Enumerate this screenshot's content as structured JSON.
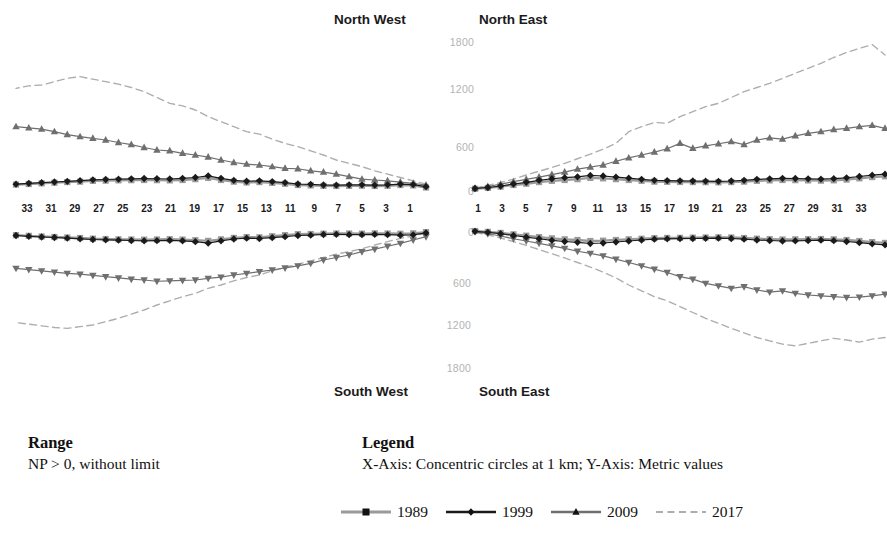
{
  "quadrants": {
    "north_west": "North West",
    "north_east": "North East",
    "south_west": "South West",
    "south_east": "South East"
  },
  "footer": {
    "range_heading": "Range",
    "range_text": "NP > 0, without limit",
    "legend_heading": "Legend",
    "legend_text": "X-Axis: Concentric circles at 1 km; Y-Axis: Metric values"
  },
  "colors": {
    "s1989": "#9a9a9a",
    "s1999": "#1a1a1a",
    "s2009": "#6f6f6f",
    "s2017": "#adadad",
    "tick_label": "#1a1a1a",
    "axis_label": "#b3b3b3",
    "title": "#1a1a1a"
  },
  "chart_data": {
    "type": "line",
    "title": "",
    "xlabel": "X-Axis: Concentric circles at 1 km",
    "ylabel": "Y-Axis: Metric values",
    "grid": false,
    "legend_position": "bottom",
    "x": [
      1,
      2,
      3,
      4,
      5,
      6,
      7,
      8,
      9,
      10,
      11,
      12,
      13,
      14,
      15,
      16,
      17,
      18,
      19,
      20,
      21,
      22,
      23,
      24,
      25,
      26,
      27,
      28,
      29,
      30,
      31,
      32,
      33
    ],
    "x_tick_labels_west": [
      "33",
      "31",
      "29",
      "27",
      "25",
      "23",
      "21",
      "19",
      "17",
      "15",
      "13",
      "11",
      "9",
      "7",
      "5",
      "3",
      "1"
    ],
    "x_tick_labels_east": [
      "1",
      "3",
      "5",
      "7",
      "9",
      "11",
      "13",
      "15",
      "17",
      "19",
      "21",
      "23",
      "25",
      "27",
      "29",
      "31",
      "33"
    ],
    "y_tick_labels_north": [
      "1800",
      "1200",
      "600",
      "0"
    ],
    "y_tick_labels_south": [
      "0",
      "600",
      "1200",
      "1800"
    ],
    "ylim_north": [
      0,
      1800
    ],
    "ylim_south": [
      0,
      1800
    ],
    "series_names": [
      "1989",
      "1999",
      "2009",
      "2017"
    ],
    "markers": {
      "1989": "square",
      "1999": "diamond",
      "2009": "triangle",
      "2017": "none"
    },
    "line_styles": {
      "1989": "solid",
      "1999": "solid",
      "2009": "solid",
      "2017": "dashed"
    },
    "panels": {
      "north_west": {
        "1989": [
          30,
          55,
          60,
          50,
          48,
          52,
          50,
          48,
          50,
          55,
          60,
          75,
          85,
          95,
          90,
          100,
          120,
          145,
          130,
          120,
          115,
          118,
          120,
          118,
          116,
          112,
          110,
          100,
          95,
          88,
          80,
          72,
          65
        ],
        "1999": [
          40,
          65,
          70,
          62,
          58,
          62,
          62,
          58,
          60,
          68,
          72,
          88,
          100,
          110,
          105,
          115,
          140,
          170,
          150,
          140,
          132,
          135,
          138,
          134,
          130,
          126,
          122,
          112,
          104,
          96,
          88,
          80,
          70
        ],
        "2009": [
          60,
          80,
          95,
          110,
          120,
          130,
          160,
          190,
          215,
          230,
          255,
          260,
          280,
          300,
          310,
          330,
          360,
          395,
          420,
          440,
          470,
          480,
          510,
          545,
          570,
          600,
          620,
          640,
          665,
          700,
          730,
          745,
          760
        ],
        "2017": [
          70,
          110,
          150,
          190,
          230,
          280,
          320,
          360,
          420,
          470,
          520,
          560,
          610,
          670,
          700,
          760,
          820,
          880,
          960,
          1010,
          1040,
          1110,
          1180,
          1230,
          1270,
          1300,
          1330,
          1360,
          1340,
          1300,
          1260,
          1250,
          1220
        ]
      },
      "north_east": {
        "1989": [
          15,
          25,
          40,
          60,
          75,
          95,
          110,
          120,
          130,
          145,
          140,
          130,
          120,
          110,
          100,
          98,
          96,
          95,
          94,
          92,
          95,
          100,
          110,
          115,
          120,
          118,
          115,
          112,
          116,
          125,
          140,
          155,
          165
        ],
        "1999": [
          18,
          30,
          48,
          72,
          92,
          115,
          135,
          148,
          158,
          175,
          168,
          155,
          142,
          128,
          116,
          112,
          110,
          108,
          106,
          104,
          108,
          116,
          128,
          134,
          140,
          138,
          134,
          130,
          136,
          146,
          162,
          178,
          190
        ],
        "2009": [
          20,
          42,
          70,
          100,
          128,
          155,
          185,
          215,
          250,
          275,
          300,
          345,
          385,
          420,
          455,
          495,
          560,
          500,
          530,
          555,
          580,
          545,
          600,
          625,
          610,
          650,
          680,
          700,
          725,
          740,
          760,
          775,
          740
        ],
        "2017": [
          25,
          55,
          90,
          130,
          180,
          225,
          270,
          320,
          375,
          430,
          490,
          560,
          700,
          760,
          810,
          800,
          880,
          940,
          1000,
          1040,
          1110,
          1180,
          1230,
          1280,
          1340,
          1400,
          1460,
          1520,
          1590,
          1650,
          1700,
          1745,
          1620
        ]
      },
      "south_west": {
        "1989": [
          25,
          40,
          45,
          42,
          40,
          44,
          42,
          42,
          44,
          48,
          50,
          62,
          75,
          88,
          85,
          95,
          112,
          130,
          122,
          115,
          110,
          114,
          116,
          114,
          112,
          108,
          104,
          96,
          90,
          84,
          78,
          70,
          62
        ],
        "1999": [
          35,
          58,
          62,
          56,
          52,
          56,
          56,
          52,
          54,
          62,
          66,
          80,
          92,
          102,
          98,
          108,
          130,
          158,
          140,
          130,
          124,
          128,
          130,
          126,
          122,
          118,
          114,
          106,
          98,
          90,
          84,
          76,
          66
        ],
        "2009": [
          80,
          120,
          160,
          195,
          230,
          260,
          300,
          330,
          360,
          400,
          430,
          455,
          480,
          500,
          520,
          540,
          565,
          580,
          600,
          605,
          610,
          615,
          600,
          590,
          575,
          560,
          545,
          530,
          520,
          505,
          490,
          475,
          460
        ],
        "2017": [
          40,
          70,
          100,
          140,
          180,
          225,
          260,
          290,
          330,
          370,
          410,
          450,
          490,
          540,
          570,
          610,
          660,
          700,
          760,
          800,
          850,
          900,
          960,
          1010,
          1060,
          1100,
          1140,
          1160,
          1180,
          1170,
          1150,
          1130,
          1110
        ]
      },
      "south_east": {
        "1989": [
          12,
          22,
          35,
          52,
          68,
          85,
          100,
          112,
          120,
          132,
          128,
          120,
          112,
          105,
          98,
          95,
          94,
          92,
          90,
          88,
          90,
          96,
          104,
          110,
          114,
          112,
          110,
          108,
          112,
          120,
          132,
          145,
          155
        ],
        "1999": [
          16,
          28,
          44,
          66,
          85,
          105,
          124,
          138,
          148,
          162,
          156,
          144,
          132,
          120,
          110,
          106,
          104,
          102,
          100,
          98,
          102,
          110,
          120,
          126,
          132,
          130,
          126,
          122,
          128,
          138,
          152,
          166,
          178
        ],
        "2009": [
          22,
          45,
          72,
          105,
          132,
          160,
          190,
          220,
          255,
          280,
          310,
          350,
          390,
          430,
          470,
          510,
          560,
          590,
          640,
          670,
          700,
          680,
          720,
          745,
          730,
          760,
          780,
          790,
          800,
          810,
          805,
          790,
          770
        ],
        "2017": [
          28,
          60,
          95,
          140,
          185,
          235,
          285,
          335,
          390,
          445,
          505,
          575,
          660,
          730,
          800,
          850,
          920,
          990,
          1060,
          1120,
          1180,
          1235,
          1290,
          1330,
          1370,
          1390,
          1360,
          1330,
          1300,
          1320,
          1345,
          1310,
          1290
        ]
      }
    }
  }
}
